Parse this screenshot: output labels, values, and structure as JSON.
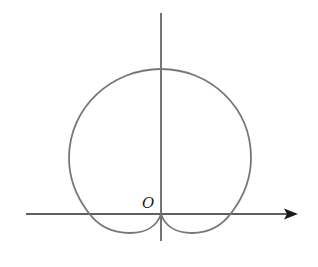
{
  "diagram": {
    "type": "polar-curve-figure",
    "origin_label": "O",
    "colors": {
      "axis": "#2a2a2a",
      "curve": "#777777",
      "background": "#ffffff"
    },
    "axes": {
      "x_axis": {
        "from": [
          26,
          214
        ],
        "to": [
          297,
          214
        ],
        "arrow": true
      },
      "y_axis": {
        "from": [
          161,
          13
        ],
        "to": [
          161,
          241
        ],
        "arrow": false
      }
    },
    "curve_key_points": {
      "top": [
        161,
        69
      ],
      "left_extreme": [
        69,
        158
      ],
      "right_extreme": [
        251,
        158
      ],
      "left_lobe_bottom": [
        130,
        233
      ],
      "right_lobe_bottom": [
        192,
        233
      ],
      "cusp": [
        161,
        214
      ]
    }
  }
}
